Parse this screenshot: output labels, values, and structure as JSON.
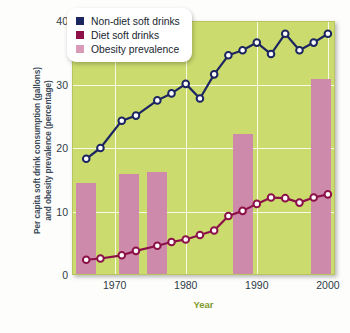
{
  "chart_data": {
    "type": "line",
    "title": "",
    "xlabel": "Year",
    "ylabel": "Per capita soft drink consumption (gallons) and obesity prevalence (percentage)",
    "ylabel_line1": "Per capita soft drink consumption (gallons)",
    "ylabel_line2": "and obesity prevalence (percentage)",
    "xlim": [
      1964,
      2001
    ],
    "ylim": [
      0,
      40
    ],
    "yticks": [
      0,
      10,
      20,
      30,
      40
    ],
    "xticks": [
      1970,
      1980,
      1990,
      2000
    ],
    "grid": true,
    "legend_position": "top-left",
    "plot_background": "#ccdb6e",
    "series": [
      {
        "name": "Non-diet soft drinks",
        "type": "line",
        "color": "#1b2560",
        "marker": "circle-open",
        "x": [
          1966,
          1968,
          1971,
          1973,
          1976,
          1978,
          1980,
          1982,
          1984,
          1986,
          1988,
          1990,
          1992,
          1994,
          1996,
          1998,
          2000
        ],
        "values": [
          18.3,
          20.0,
          24.3,
          25.1,
          27.5,
          28.6,
          30.1,
          27.8,
          31.6,
          34.6,
          35.4,
          36.6,
          34.8,
          38.0,
          35.4,
          36.6,
          38.0
        ]
      },
      {
        "name": "Diet soft drinks",
        "type": "line",
        "color": "#8c1148",
        "marker": "circle-open",
        "x": [
          1966,
          1968,
          1971,
          1973,
          1976,
          1978,
          1980,
          1982,
          1984,
          1986,
          1988,
          1990,
          1992,
          1994,
          1996,
          1998,
          2000
        ],
        "values": [
          2.4,
          2.6,
          3.1,
          3.8,
          4.6,
          5.2,
          5.6,
          6.3,
          7.0,
          9.3,
          10.1,
          11.2,
          12.2,
          12.1,
          11.4,
          12.2,
          12.7
        ]
      },
      {
        "name": "Obesity prevalence",
        "type": "bar",
        "color": "#cd8aaa",
        "x": [
          1966,
          1972,
          1976,
          1988,
          1999
        ],
        "values": [
          14.5,
          15.9,
          16.2,
          22.2,
          30.9
        ]
      }
    ]
  },
  "legend": {
    "items": [
      {
        "label": "Non-diet soft drinks",
        "color": "#1b2560"
      },
      {
        "label": "Diet soft drinks",
        "color": "#8c1148"
      },
      {
        "label": "Obesity prevalence",
        "color": "#d79ab7"
      }
    ]
  },
  "axes": {
    "y_tick_labels": [
      "40",
      "30",
      "20",
      "10",
      "0"
    ],
    "x_tick_labels": [
      "1970",
      "1980",
      "1990",
      "2000"
    ],
    "x_axis_title": "Year",
    "y_axis_title_line1": "Per capita soft drink consumption (gallons)",
    "y_axis_title_line2": "and obesity prevalence (percentage)"
  }
}
